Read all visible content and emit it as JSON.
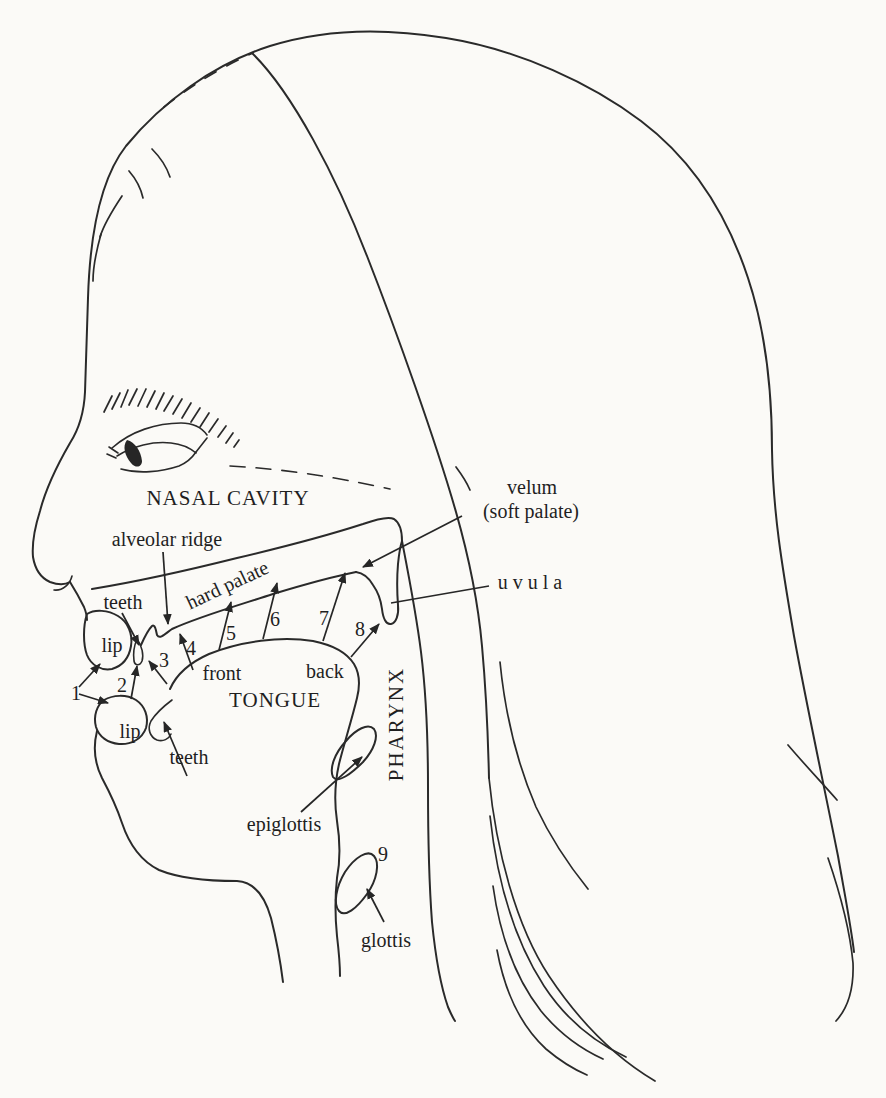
{
  "colors": {
    "paper": "#fbfaf7",
    "ink": "#2a2a2a"
  },
  "diagram": {
    "labels": {
      "nasal_cavity": "NASAL CAVITY",
      "alveolar_ridge": "alveolar ridge",
      "hard_palate": "hard palate",
      "velum": "velum",
      "soft_palate": "(soft palate)",
      "uvula": "u v u l a",
      "upper_teeth": "teeth",
      "upper_lip": "lip",
      "lower_lip": "lip",
      "lower_teeth": "teeth",
      "tongue_front": "front",
      "tongue_back": "back",
      "tongue": "TONGUE",
      "pharynx": "PHARYNX",
      "epiglottis": "epiglottis",
      "glottis": "glottis"
    },
    "place_markers": [
      "1",
      "2",
      "3",
      "4",
      "5",
      "6",
      "7",
      "8",
      "9"
    ]
  }
}
